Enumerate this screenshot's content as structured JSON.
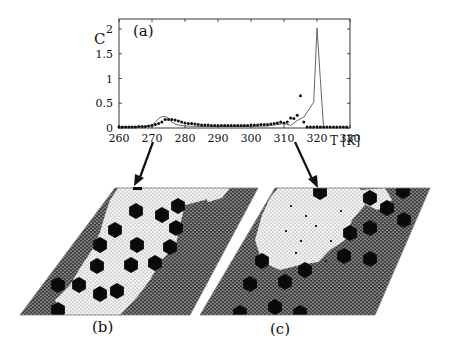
{
  "figure": {
    "panel_a_label": "(a)",
    "panel_b_label": "(b)",
    "panel_c_label": "(c)",
    "y_axis_label": "C",
    "x_axis_label": "T [K]"
  },
  "colors": {
    "ink": "#111111",
    "grid_dark": "#3a3a3a",
    "grid_light": "#efefef",
    "line": "#444444"
  },
  "chart_data": {
    "type": "line",
    "title": "(a)",
    "xlabel": "T [K]",
    "ylabel": "C",
    "xlim": [
      260,
      330
    ],
    "ylim": [
      0,
      2.2
    ],
    "x_ticks": [
      260,
      270,
      280,
      290,
      300,
      310,
      320,
      330
    ],
    "y_ticks": [
      0,
      0.5,
      1,
      1.5,
      2
    ],
    "grid": false,
    "legend": "none",
    "series": [
      {
        "name": "simulation (points)",
        "style": "markers",
        "x": [
          260,
          261,
          262,
          263,
          264,
          265,
          266,
          267,
          268,
          269,
          270,
          271,
          272,
          273,
          274,
          275,
          276,
          277,
          278,
          279,
          280,
          281,
          282,
          283,
          284,
          285,
          286,
          287,
          288,
          289,
          290,
          291,
          292,
          293,
          294,
          295,
          296,
          297,
          298,
          299,
          300,
          301,
          302,
          303,
          304,
          305,
          306,
          307,
          308,
          309,
          310,
          311,
          312,
          313,
          314,
          315,
          316,
          317,
          318,
          319,
          320,
          321,
          322,
          323,
          324,
          325,
          326,
          327,
          328,
          329
        ],
        "y": [
          0.02,
          0.02,
          0.02,
          0.02,
          0.02,
          0.02,
          0.03,
          0.03,
          0.03,
          0.04,
          0.05,
          0.07,
          0.09,
          0.12,
          0.17,
          0.17,
          0.17,
          0.16,
          0.14,
          0.12,
          0.1,
          0.09,
          0.09,
          0.08,
          0.07,
          0.06,
          0.06,
          0.06,
          0.05,
          0.05,
          0.05,
          0.05,
          0.05,
          0.05,
          0.05,
          0.05,
          0.05,
          0.05,
          0.05,
          0.05,
          0.06,
          0.06,
          0.06,
          0.07,
          0.07,
          0.07,
          0.08,
          0.09,
          0.1,
          0.12,
          0.1,
          0.12,
          0.2,
          0.19,
          0.26,
          0.65,
          0.12,
          -0.02,
          -0.02,
          -0.02,
          -0.02,
          -0.02,
          -0.02,
          -0.02,
          -0.02,
          -0.02,
          -0.02,
          -0.02,
          -0.02,
          -0.02
        ]
      },
      {
        "name": "model (line)",
        "style": "line",
        "x": [
          260,
          268,
          270,
          271,
          272,
          273,
          274,
          275,
          276,
          277,
          278,
          280,
          285,
          290,
          300,
          305,
          308,
          310,
          312,
          314,
          316,
          318,
          319,
          320,
          321,
          322
        ],
        "y": [
          0.02,
          0.03,
          0.06,
          0.12,
          0.19,
          0.23,
          0.23,
          0.2,
          0.12,
          0.08,
          0.06,
          0.04,
          0.03,
          0.03,
          0.03,
          0.04,
          0.07,
          0.09,
          0.05,
          0.15,
          0.22,
          0.42,
          0.52,
          2.02,
          1.0,
          -0.02
        ]
      }
    ]
  }
}
